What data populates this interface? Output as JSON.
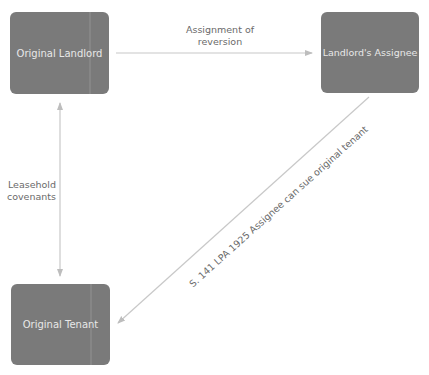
{
  "diagram": {
    "nodes": [
      {
        "id": "original-landlord",
        "label": "Original Landlord"
      },
      {
        "id": "landlords-assignee",
        "label": "Landlord's Assignee"
      },
      {
        "id": "original-tenant",
        "label": "Original Tenant"
      }
    ],
    "edges": [
      {
        "from": "original-landlord",
        "to": "landlords-assignee",
        "label_line1": "Assignment of",
        "label_line2": "reversion",
        "direction": "forward"
      },
      {
        "from": "original-landlord",
        "to": "original-tenant",
        "label_line1": "Leasehold",
        "label_line2": "covenants",
        "direction": "both"
      },
      {
        "from": "landlords-assignee",
        "to": "original-tenant",
        "label": "S. 141 LPA 1925 Assignee can sue original tenant",
        "direction": "forward"
      }
    ],
    "colors": {
      "node_fill": "#7a7a7a",
      "node_text": "#e8e8e8",
      "edge_line": "#c8c8c8",
      "edge_label": "#6a6a6a"
    }
  }
}
